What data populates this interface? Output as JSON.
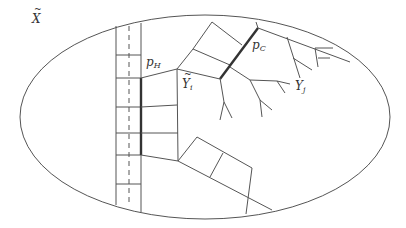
{
  "diagram": {
    "colors": {
      "line": "#555555",
      "thick": "#333333",
      "label": "#333333",
      "background": "#ffffff"
    },
    "labels": {
      "space": {
        "base": "X",
        "accent": "tilde"
      },
      "path_h": {
        "base": "p",
        "sub": "H"
      },
      "path_c": {
        "base": "p",
        "sub": "C"
      },
      "node_i": {
        "base": "Y",
        "sub": "i",
        "accent": "tilde"
      },
      "node_j": {
        "base": "Y",
        "sub": "j"
      }
    }
  }
}
